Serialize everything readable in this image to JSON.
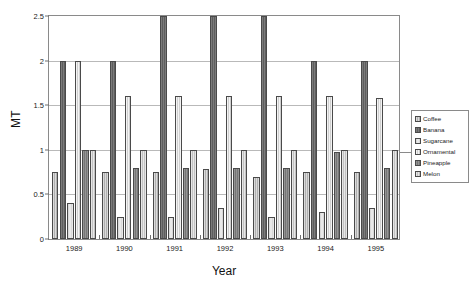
{
  "chart_data": {
    "type": "bar",
    "title": "",
    "subtitle": "",
    "xlabel": "Year",
    "ylabel": "MT",
    "categories": [
      "1989",
      "1990",
      "1991",
      "1992",
      "1993",
      "1994",
      "1995"
    ],
    "ylim": [
      0,
      2.5
    ],
    "yticks": [
      0,
      0.5,
      1,
      1.5,
      2,
      2.5
    ],
    "ytick_labels": [
      "0",
      "0.5",
      "1",
      "1.5",
      "2",
      "2.5"
    ],
    "grid": true,
    "legend_position": "right",
    "series": [
      {
        "name": "Coffee",
        "pattern": "light-gray-hatch",
        "color": "#b0b0b0",
        "values": [
          0.75,
          0.75,
          0.75,
          0.78,
          0.7,
          0.75,
          0.75
        ]
      },
      {
        "name": "Banana",
        "pattern": "dark-gray-solid",
        "color": "#5e5e5e",
        "values": [
          2.0,
          2.0,
          2.5,
          2.5,
          2.5,
          2.0,
          2.0
        ]
      },
      {
        "name": "Sugarcane",
        "pattern": "white",
        "color": "#e8e8e8",
        "values": [
          0.4,
          0.25,
          0.25,
          0.35,
          0.25,
          0.3,
          0.35
        ]
      },
      {
        "name": "Ornamental",
        "pattern": "very-light-gray-hatch",
        "color": "#cfcfcf",
        "values": [
          2.0,
          1.6,
          1.6,
          1.6,
          1.6,
          1.6,
          1.58
        ]
      },
      {
        "name": "Pineapple",
        "pattern": "medium-dark-gray",
        "color": "#767676",
        "values": [
          1.0,
          0.8,
          0.8,
          0.8,
          0.8,
          0.97,
          0.8
        ]
      },
      {
        "name": "Melon",
        "pattern": "light-gray",
        "color": "#c2c2c2",
        "values": [
          1.0,
          1.0,
          1.0,
          1.0,
          1.0,
          1.0,
          1.0
        ]
      }
    ]
  },
  "axes": {
    "y_title": "MT",
    "x_title": "Year"
  }
}
